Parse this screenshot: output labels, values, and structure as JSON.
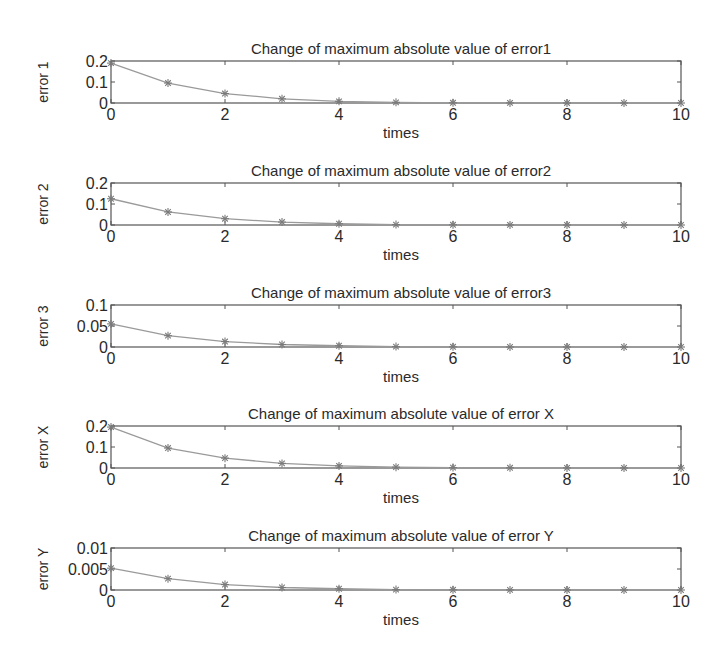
{
  "figure": {
    "layout": {
      "plot_left": 111,
      "plot_right": 681,
      "subplots_top": [
        61,
        183,
        305,
        426,
        548
      ],
      "plot_height": 42
    },
    "colors": {
      "axes": "#555555",
      "line": "#9a9a9a",
      "marker": "#7a7a7a",
      "text": "#2a2a2a",
      "background": "#ffffff"
    }
  },
  "chart_data": [
    {
      "type": "line",
      "title": "Change of maximum absolute value of error1",
      "xlabel": "times",
      "ylabel": "error 1",
      "x": [
        0,
        1,
        2,
        3,
        4,
        5,
        6,
        7,
        8,
        9,
        10
      ],
      "values": [
        0.19,
        0.095,
        0.045,
        0.02,
        0.008,
        0.003,
        0.001,
        0.0005,
        0.0002,
        0.0001,
        0.0
      ],
      "xlim": [
        0,
        10
      ],
      "ylim": [
        0,
        0.2
      ],
      "xticks": [
        "0",
        "2",
        "4",
        "6",
        "8",
        "10"
      ],
      "yticks": [
        "0",
        "0.1",
        "0.2"
      ],
      "marker": "*",
      "grid": false
    },
    {
      "type": "line",
      "title": "Change of maximum absolute value of error2",
      "xlabel": "times",
      "ylabel": "error 2",
      "x": [
        0,
        1,
        2,
        3,
        4,
        5,
        6,
        7,
        8,
        9,
        10
      ],
      "values": [
        0.125,
        0.062,
        0.03,
        0.014,
        0.006,
        0.002,
        0.001,
        0.0005,
        0.0002,
        0.0001,
        0.0
      ],
      "xlim": [
        0,
        10
      ],
      "ylim": [
        0,
        0.2
      ],
      "xticks": [
        "0",
        "2",
        "4",
        "6",
        "8",
        "10"
      ],
      "yticks": [
        "0",
        "0.1",
        "0.2"
      ],
      "marker": "*",
      "grid": false
    },
    {
      "type": "line",
      "title": "Change of maximum absolute value of error3",
      "xlabel": "times",
      "ylabel": "error 3",
      "x": [
        0,
        1,
        2,
        3,
        4,
        5,
        6,
        7,
        8,
        9,
        10
      ],
      "values": [
        0.055,
        0.027,
        0.013,
        0.006,
        0.003,
        0.001,
        0.0005,
        0.0002,
        0.0001,
        0.0,
        0.0
      ],
      "xlim": [
        0,
        10
      ],
      "ylim": [
        0,
        0.1
      ],
      "xticks": [
        "0",
        "2",
        "4",
        "6",
        "8",
        "10"
      ],
      "yticks": [
        "0",
        "0.05",
        "0.1"
      ],
      "marker": "*",
      "grid": false
    },
    {
      "type": "line",
      "title": "Change of maximum absolute value of error X",
      "xlabel": "times",
      "ylabel": "error X",
      "x": [
        0,
        1,
        2,
        3,
        4,
        5,
        6,
        7,
        8,
        9,
        10
      ],
      "values": [
        0.195,
        0.095,
        0.047,
        0.022,
        0.01,
        0.004,
        0.002,
        0.001,
        0.0005,
        0.0002,
        0.0
      ],
      "xlim": [
        0,
        10
      ],
      "ylim": [
        0,
        0.2
      ],
      "xticks": [
        "0",
        "2",
        "4",
        "6",
        "8",
        "10"
      ],
      "yticks": [
        "0",
        "0.1",
        "0.2"
      ],
      "marker": "*",
      "grid": false
    },
    {
      "type": "line",
      "title": "Change of maximum absolute value of error Y",
      "xlabel": "times",
      "ylabel": "error Y",
      "x": [
        0,
        1,
        2,
        3,
        4,
        5,
        6,
        7,
        8,
        9,
        10
      ],
      "values": [
        0.0052,
        0.0027,
        0.0013,
        0.0006,
        0.0003,
        0.0001,
        5e-05,
        2e-05,
        1e-05,
        0.0,
        0.0
      ],
      "xlim": [
        0,
        10
      ],
      "ylim": [
        0,
        0.01
      ],
      "xticks": [
        "0",
        "2",
        "4",
        "6",
        "8",
        "10"
      ],
      "yticks": [
        "0",
        "0.005",
        "0.01"
      ],
      "marker": "*",
      "grid": false
    }
  ]
}
